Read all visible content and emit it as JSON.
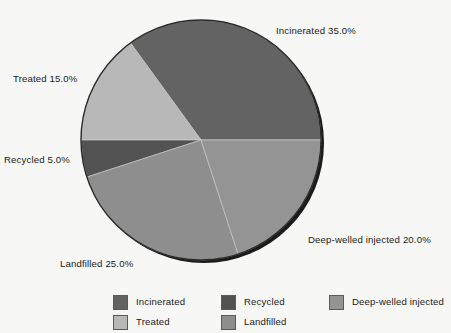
{
  "background_color": "#f7f7f5",
  "text_color": "#1a1a1a",
  "chart_data": {
    "type": "pie",
    "title": "",
    "subtitle": "",
    "xlabel": "",
    "ylabel": "",
    "legend_position": "bottom",
    "grid": false,
    "total_percent": 100.0,
    "units": "%",
    "categories": [
      "Incinerated",
      "Treated",
      "Recycled",
      "Landfilled",
      "Deep-welled injected"
    ],
    "values": [
      35.0,
      15.0,
      5.0,
      25.0,
      20.0
    ],
    "colors": [
      "#636363",
      "#b8b8b8",
      "#525252",
      "#8e8e8e",
      "#949494"
    ],
    "slices": [
      {
        "label": "Incinerated",
        "value": 35.0,
        "value_text": "35.0%",
        "color": "#636363",
        "callout": "Incinerated 35.0%"
      },
      {
        "label": "Treated",
        "value": 15.0,
        "value_text": "15.0%",
        "color": "#b8b8b8",
        "callout": "Treated 15.0%"
      },
      {
        "label": "Recycled",
        "value": 5.0,
        "value_text": "5.0%",
        "color": "#525252",
        "callout": "Recycled 5.0%"
      },
      {
        "label": "Landfilled",
        "value": 25.0,
        "value_text": "25.0%",
        "color": "#8e8e8e",
        "callout": "Landfilled 25.0%"
      },
      {
        "label": "Deep-welled injected",
        "value": 20.0,
        "value_text": "20.0%",
        "color": "#949494",
        "callout": "Deep-welled injected 20.0%"
      }
    ]
  },
  "callouts": {
    "incinerated": "Incinerated 35.0%",
    "treated": "Treated 15.0%",
    "recycled": "Recycled 5.0%",
    "landfilled": "Landfilled 25.0%",
    "deepwelled": "Deep-welled injected 20.0%"
  },
  "legend": {
    "items": [
      {
        "label": "Incinerated",
        "color": "#636363"
      },
      {
        "label": "Recycled",
        "color": "#525252"
      },
      {
        "label": "Deep-welled injected",
        "color": "#949494"
      },
      {
        "label": "Treated",
        "color": "#b8b8b8"
      },
      {
        "label": "Landfilled",
        "color": "#8e8e8e"
      }
    ]
  }
}
